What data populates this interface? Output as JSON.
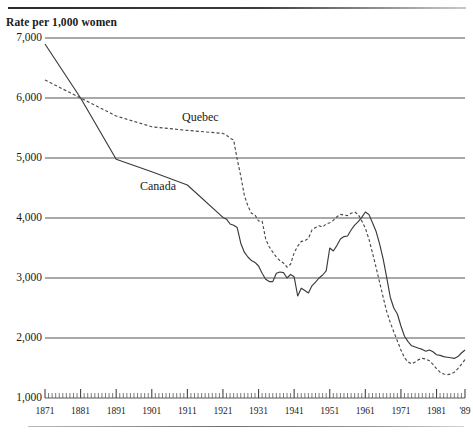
{
  "chart_data": {
    "type": "line",
    "title": "Rate per 1,000 women",
    "xlabel": "",
    "ylabel": "Rate per 1,000 women",
    "xlim": [
      1871,
      1989
    ],
    "ylim": [
      1000,
      7000
    ],
    "grid": true,
    "legend_position": "inline-annotations",
    "y_ticks": [
      "7,000",
      "6,000",
      "5,000",
      "4,000",
      "3,000",
      "2,000",
      "1,000"
    ],
    "y_tick_values": [
      7000,
      6000,
      5000,
      4000,
      3000,
      2000,
      1000
    ],
    "x_ticks": [
      "1871",
      "1881",
      "1891",
      "1901",
      "1911",
      "1921",
      "1931",
      "1941",
      "1951",
      "1961",
      "1971",
      "1981",
      "'89"
    ],
    "x_tick_values": [
      1871,
      1881,
      1891,
      1901,
      1911,
      1921,
      1931,
      1941,
      1951,
      1961,
      1971,
      1981,
      1989
    ],
    "minor_tick_interval": 1,
    "series": [
      {
        "name": "Canada",
        "style": "solid",
        "color": "#3a3a3a",
        "x": [
          1871,
          1881,
          1891,
          1901,
          1911,
          1921,
          1922,
          1923,
          1924,
          1925,
          1926,
          1927,
          1928,
          1929,
          1930,
          1931,
          1932,
          1933,
          1934,
          1935,
          1936,
          1937,
          1938,
          1939,
          1940,
          1941,
          1942,
          1943,
          1944,
          1945,
          1946,
          1947,
          1948,
          1949,
          1950,
          1951,
          1952,
          1953,
          1954,
          1955,
          1956,
          1957,
          1958,
          1959,
          1960,
          1961,
          1962,
          1963,
          1964,
          1965,
          1966,
          1967,
          1968,
          1969,
          1970,
          1971,
          1972,
          1973,
          1974,
          1975,
          1976,
          1977,
          1978,
          1979,
          1980,
          1981,
          1982,
          1983,
          1984,
          1985,
          1986,
          1987,
          1988,
          1989
        ],
        "values": [
          6900,
          6000,
          4980,
          4770,
          4550,
          4010,
          3980,
          3900,
          3880,
          3840,
          3580,
          3430,
          3350,
          3290,
          3260,
          3200,
          3080,
          2980,
          2940,
          2940,
          3080,
          3100,
          3090,
          3000,
          3060,
          3020,
          2700,
          2830,
          2790,
          2750,
          2870,
          2930,
          3000,
          3050,
          3120,
          3500,
          3450,
          3540,
          3650,
          3690,
          3700,
          3800,
          3880,
          3940,
          4010,
          4100,
          4060,
          3920,
          3780,
          3570,
          3320,
          3010,
          2680,
          2500,
          2400,
          2200,
          2030,
          1940,
          1870,
          1850,
          1830,
          1810,
          1780,
          1800,
          1770,
          1720,
          1710,
          1690,
          1680,
          1670,
          1660,
          1690,
          1750,
          1800
        ]
      },
      {
        "name": "Quebec",
        "style": "dashed",
        "color": "#4a4a4a",
        "x": [
          1871,
          1881,
          1891,
          1901,
          1911,
          1921,
          1922,
          1923,
          1924,
          1925,
          1926,
          1927,
          1928,
          1929,
          1930,
          1931,
          1932,
          1933,
          1934,
          1935,
          1936,
          1937,
          1938,
          1939,
          1940,
          1941,
          1942,
          1943,
          1944,
          1945,
          1946,
          1947,
          1948,
          1949,
          1950,
          1951,
          1952,
          1953,
          1954,
          1955,
          1956,
          1957,
          1958,
          1959,
          1960,
          1961,
          1962,
          1963,
          1964,
          1965,
          1966,
          1967,
          1968,
          1969,
          1970,
          1971,
          1972,
          1973,
          1974,
          1975,
          1976,
          1977,
          1978,
          1979,
          1980,
          1981,
          1982,
          1983,
          1984,
          1985,
          1986,
          1987,
          1988,
          1989
        ],
        "values": [
          6300,
          6000,
          5700,
          5520,
          5460,
          5410,
          5380,
          5330,
          5300,
          4980,
          4700,
          4380,
          4200,
          4080,
          4050,
          3950,
          3950,
          3650,
          3520,
          3430,
          3350,
          3290,
          3250,
          3180,
          3230,
          3420,
          3530,
          3610,
          3620,
          3660,
          3800,
          3840,
          3870,
          3850,
          3900,
          3920,
          3960,
          4020,
          4060,
          4050,
          4040,
          4080,
          4100,
          4060,
          3950,
          3830,
          3650,
          3420,
          3180,
          2930,
          2680,
          2440,
          2260,
          2100,
          1950,
          1800,
          1670,
          1600,
          1570,
          1600,
          1640,
          1660,
          1650,
          1620,
          1560,
          1490,
          1430,
          1400,
          1390,
          1400,
          1430,
          1490,
          1560,
          1640
        ]
      }
    ]
  },
  "annotations": {
    "quebec_label": "Quebec",
    "canada_label": "Canada"
  }
}
